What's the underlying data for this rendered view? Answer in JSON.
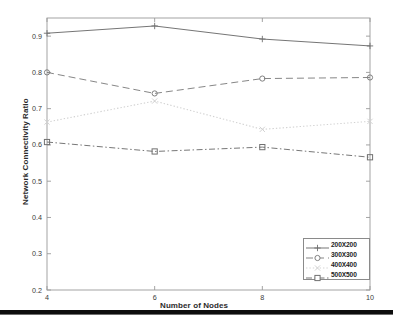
{
  "chart_data": {
    "type": "line",
    "title": "",
    "xlabel": "Number of Nodes",
    "ylabel": "Network Connectivity Ratio",
    "x": [
      4,
      6,
      8,
      10
    ],
    "xlim": [
      4,
      10
    ],
    "ylim": [
      0.2,
      0.95
    ],
    "xticks": [
      "4",
      "6",
      "8",
      "10"
    ],
    "yticks": [
      "0.2",
      "0.3",
      "0.4",
      "0.5",
      "0.6",
      "0.7",
      "0.8",
      "0.9"
    ],
    "grid": false,
    "legend_position": "lower right",
    "series": [
      {
        "name": "200X200",
        "values": [
          0.908,
          0.928,
          0.892,
          0.873
        ],
        "color": "#6e6e6e",
        "linestyle": "solid",
        "marker": "plus"
      },
      {
        "name": "300X300",
        "values": [
          0.8,
          0.742,
          0.783,
          0.786
        ],
        "color": "#808080",
        "linestyle": "dashed",
        "marker": "circle"
      },
      {
        "name": "400X400",
        "values": [
          0.663,
          0.721,
          0.643,
          0.665
        ],
        "color": "#d2d2d2",
        "linestyle": "dotted",
        "marker": "cross"
      },
      {
        "name": "500X500",
        "values": [
          0.608,
          0.582,
          0.594,
          0.566
        ],
        "color": "#707070",
        "linestyle": "dashdot",
        "marker": "square"
      }
    ]
  },
  "axes": {
    "frame_color": "#9a9a9a",
    "background": "#ffffff"
  },
  "legend": {
    "entries": [
      "200X200",
      "300X300",
      "400X400",
      "500X500"
    ]
  },
  "footer": {
    "bar_color": "#0d0d0d"
  }
}
